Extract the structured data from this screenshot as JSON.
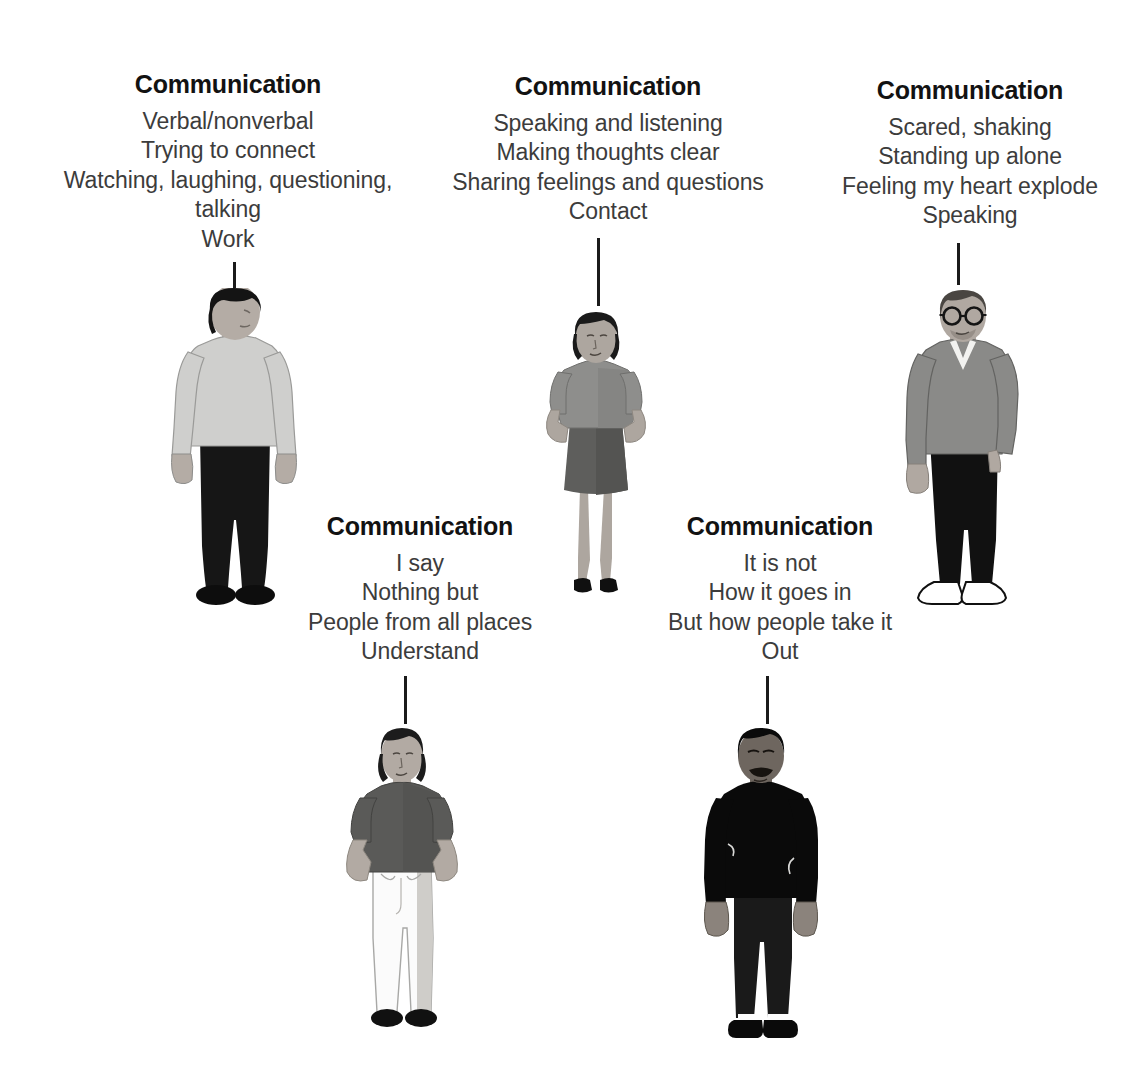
{
  "page": {
    "background_color": "#ffffff",
    "heading_color": "#121212",
    "body_text_color": "#3c3c3c",
    "stem_color": "#1b1b1b"
  },
  "poems": [
    {
      "id": "poem-1",
      "title": "Communication",
      "lines": [
        "Verbal/nonverbal",
        "Trying to connect",
        "Watching, laughing, questioning, talking",
        "Work"
      ]
    },
    {
      "id": "poem-2",
      "title": "Communication",
      "lines": [
        "Speaking and listening",
        "Making thoughts clear",
        "Sharing feelings and questions",
        "Contact"
      ]
    },
    {
      "id": "poem-3",
      "title": "Communication",
      "lines": [
        "Scared, shaking",
        "Standing up alone",
        "Feeling my heart explode",
        "Speaking"
      ]
    },
    {
      "id": "poem-4",
      "title": "Communication",
      "lines": [
        "I say",
        "Nothing but",
        "People from all places",
        "Understand"
      ]
    },
    {
      "id": "poem-5",
      "title": "Communication",
      "lines": [
        "It is not",
        "How it goes in",
        "But how people take it",
        "Out"
      ]
    }
  ],
  "figures": [
    {
      "id": "figure-1",
      "description": "standing-man-light-sweater",
      "hair_color": "#141414",
      "skin_color": "#b4aca5",
      "top_color": "#cfcfcd",
      "bottom_color": "#161616",
      "shoe_color": "#0d0d0d"
    },
    {
      "id": "figure-2",
      "description": "standing-woman-skirt-hands-on-hips",
      "hair_color": "#1a1a1a",
      "skin_color": "#ada69f",
      "top_color": "#8e8e8c",
      "bottom_color": "#5e5e5c",
      "shoe_color": "#101010"
    },
    {
      "id": "figure-3",
      "description": "standing-man-glasses-vneck-sweater",
      "hair_color": "#4a4642",
      "skin_color": "#b0a8a1",
      "top_color": "#8a8a88",
      "bottom_color": "#111111",
      "shoe_color": "#ffffff"
    },
    {
      "id": "figure-4",
      "description": "standing-woman-white-pants-hands-in-pockets",
      "hair_color": "#1c1c1c",
      "skin_color": "#b2aaa3",
      "top_color": "#5a5a58",
      "bottom_color": "#fbfbfb",
      "shoe_color": "#111111"
    },
    {
      "id": "figure-5",
      "description": "standing-man-black-shirt-mustache",
      "hair_color": "#0a0a0a",
      "skin_color": "#6e665f",
      "top_color": "#0a0a0a",
      "bottom_color": "#1a1a1a",
      "shoe_color": "#0a0a0a"
    }
  ],
  "connectors": [
    {
      "id": "stem-1",
      "from": "poem-1",
      "to": "figure-1"
    },
    {
      "id": "stem-2",
      "from": "poem-2",
      "to": "figure-2"
    },
    {
      "id": "stem-3",
      "from": "poem-3",
      "to": "figure-3"
    },
    {
      "id": "stem-4",
      "from": "poem-4",
      "to": "figure-4"
    },
    {
      "id": "stem-5",
      "from": "poem-5",
      "to": "figure-5"
    }
  ]
}
